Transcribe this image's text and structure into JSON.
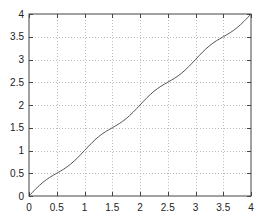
{
  "chart_data": {
    "type": "line",
    "title": "",
    "xlabel": "",
    "ylabel": "",
    "xlim": [
      0,
      4
    ],
    "ylim": [
      0,
      4
    ],
    "grid": true,
    "legend": null,
    "x_ticks": [
      "0",
      "0.5",
      "1",
      "1.5",
      "2",
      "2.5",
      "3",
      "3.5",
      "4"
    ],
    "y_ticks": [
      "0",
      "0.5",
      "1",
      "1.5",
      "2",
      "2.5",
      "3",
      "3.5",
      "4"
    ],
    "series": [
      {
        "name": "curve",
        "color": "#555555",
        "x": [
          0,
          0.125,
          0.25,
          0.375,
          0.5,
          0.625,
          0.75,
          0.875,
          1,
          1.125,
          1.25,
          1.375,
          1.5,
          1.625,
          1.75,
          1.875,
          2,
          2.125,
          2.25,
          2.375,
          2.5,
          2.625,
          2.75,
          2.875,
          3,
          3.125,
          3.25,
          3.375,
          3.5,
          3.625,
          3.75,
          3.875,
          4
        ],
        "y": [
          0,
          0.16,
          0.3,
          0.41,
          0.5,
          0.59,
          0.7,
          0.84,
          1,
          1.16,
          1.3,
          1.41,
          1.5,
          1.59,
          1.7,
          1.84,
          2,
          2.16,
          2.3,
          2.41,
          2.5,
          2.59,
          2.7,
          2.84,
          3,
          3.16,
          3.3,
          3.41,
          3.5,
          3.59,
          3.7,
          3.84,
          4
        ]
      }
    ]
  }
}
